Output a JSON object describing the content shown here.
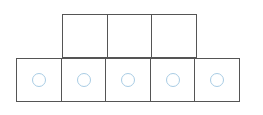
{
  "diagram": {
    "kind": "two-row-cell-grid-with-counters",
    "colors": {
      "background": "#ffffff",
      "cell_fill": "#ffffff",
      "cell_stroke": "#555555",
      "token_stroke": "#a8cce4"
    },
    "geometry": {
      "canvas_width": 263,
      "canvas_height": 115,
      "cell_width": 46,
      "cell_height": 44,
      "border_width": 1.4,
      "token_diameter": 14
    },
    "rows": [
      {
        "name": "top-row",
        "left": 62,
        "top": 14,
        "cell_count": 3,
        "cells": [
          {
            "name": "top-cell-1",
            "has_token": false,
            "token_label": ""
          },
          {
            "name": "top-cell-2",
            "has_token": false,
            "token_label": ""
          },
          {
            "name": "top-cell-3",
            "has_token": false,
            "token_label": ""
          }
        ]
      },
      {
        "name": "bottom-row",
        "left": 16,
        "top": 58,
        "cell_count": 5,
        "cells": [
          {
            "name": "bottom-cell-1",
            "has_token": true,
            "token_label": ""
          },
          {
            "name": "bottom-cell-2",
            "has_token": true,
            "token_label": ""
          },
          {
            "name": "bottom-cell-3",
            "has_token": true,
            "token_label": ""
          },
          {
            "name": "bottom-cell-4",
            "has_token": true,
            "token_label": ""
          },
          {
            "name": "bottom-cell-5",
            "has_token": true,
            "token_label": ""
          }
        ]
      }
    ],
    "counts": {
      "total_cells": 8,
      "top_row_cells": 3,
      "bottom_row_cells": 5,
      "total_tokens": 5
    }
  }
}
